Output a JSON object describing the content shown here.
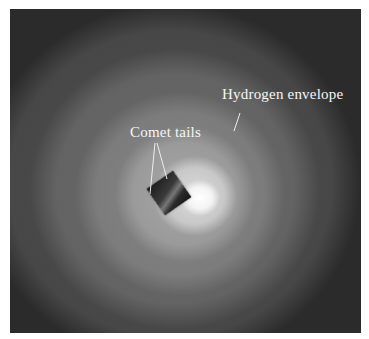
{
  "figure": {
    "labels": {
      "hydrogen_envelope": "Hydrogen envelope",
      "comet_tails": "Comet tails"
    },
    "inset_icon": "comet-tail-inset"
  }
}
